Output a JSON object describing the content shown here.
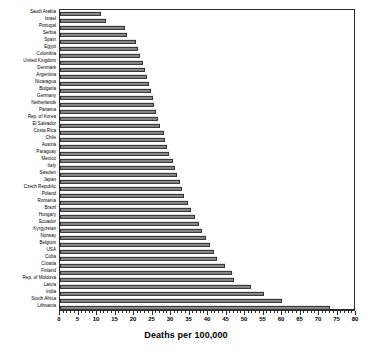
{
  "chart_data": {
    "type": "bar",
    "orientation": "horizontal",
    "title": "",
    "xlabel": "Deaths per 100,000",
    "ylabel": "",
    "xlim": [
      0,
      80
    ],
    "xtick_step": 5,
    "xtick_minor_step": 1,
    "grid": false,
    "legend": null,
    "bar_color": "#8a8a8a",
    "bar_edge_color": "#333333",
    "axis_color": "#2b2b2b",
    "xticks": [
      0,
      5,
      10,
      15,
      20,
      25,
      30,
      35,
      40,
      45,
      50,
      55,
      60,
      65,
      70,
      75,
      80
    ],
    "categories": [
      "Saudi Arabia",
      "Israel",
      "Portugal",
      "Serbia",
      "Spain",
      "Egypt",
      "Colombia",
      "United Kingdom",
      "Denmark",
      "Argentina",
      "Nicaragua",
      "Bulgaria",
      "Germany",
      "Netherlands",
      "Panama",
      "Rep. of Korea",
      "El Salvador",
      "Costa Rica",
      "Chile",
      "Austria",
      "Paraguay",
      "Mexico",
      "Italy",
      "Sweden",
      "Japan",
      "Czech Republic",
      "Poland",
      "Romania",
      "Brazil",
      "Hungary",
      "Ecuador",
      "Kyrgyzstan",
      "Norway",
      "Belgium",
      "USA",
      "Cuba",
      "Croatia",
      "Finland",
      "Rep. of Moldova",
      "Latvia",
      "India",
      "South Africa",
      "Lithuania"
    ],
    "values": [
      11.0,
      12.5,
      17.5,
      18.0,
      20.5,
      21.0,
      21.5,
      22.5,
      23.0,
      23.5,
      24.0,
      24.5,
      25.0,
      25.5,
      26.0,
      26.5,
      27.0,
      28.0,
      28.5,
      29.0,
      29.5,
      30.5,
      31.0,
      31.5,
      32.5,
      33.0,
      33.5,
      34.5,
      35.5,
      36.5,
      37.5,
      38.5,
      39.5,
      40.5,
      41.5,
      42.5,
      44.5,
      46.5,
      47.0,
      51.5,
      55.0,
      60.0,
      73.0
    ]
  }
}
